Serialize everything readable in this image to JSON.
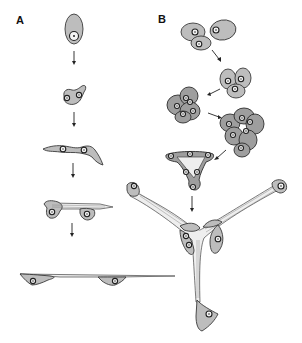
{
  "figure": {
    "panels": [
      {
        "id": "A",
        "label": "A",
        "stages": [
          "single-rounded-cell",
          "binucleate-irregular-cell",
          "elongated-cell-pair",
          "cell-pair-with-process",
          "thin-elongated-strand"
        ],
        "arrow_count": 4
      },
      {
        "id": "B",
        "label": "B",
        "stages": [
          "three-separate-cells",
          "three-cell-cluster",
          "four-cell-aggregate",
          "multicell-aggregate",
          "triangular-cell-network",
          "three-armed-branching-structure"
        ],
        "arrow_count": 5
      }
    ],
    "colors": {
      "cytoplasm": "#bdbdbd",
      "outline": "#3a3a3a",
      "process": "#eeeeee",
      "background": "#ffffff"
    }
  }
}
